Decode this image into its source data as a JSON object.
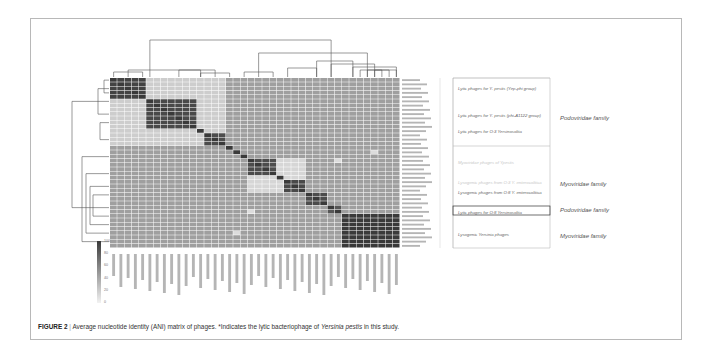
{
  "caption": {
    "figure_label": "FIGURE 2",
    "separator": "|",
    "text": "Average nucleotide identity (ANI) matrix of phages. *Indicates the lytic bacteriophage of ",
    "italic": "Yersinia pestis",
    "tail": " in this study."
  },
  "groups": [
    {
      "label": "Lytic phages for Y. pestis (Yep-phi group)",
      "faint": false
    },
    {
      "label": "Lytic phages for Y. pestis (phi-A1122 group)",
      "faint": false
    },
    {
      "label": "Lytic phages for  O:3 Yersinosoltia",
      "faint": false
    },
    {
      "label": "Myoviridae phages of Ypestis",
      "faint": true
    },
    {
      "label": "Lysogenic phages from O:3 Y. enterocolitica",
      "faint": true
    },
    {
      "label": "Lysogenic phages from O:8 Y. enterocolitica",
      "faint": false
    },
    {
      "label": "Lytic phages for  O:8 Yersinosoltia",
      "faint": false
    },
    {
      "label": "Lysogenic Yersinia phages",
      "faint": false
    }
  ],
  "families": [
    {
      "label": "Podoviridae family"
    },
    {
      "label": "Myoviridae family"
    },
    {
      "label": "Podoviridae family"
    },
    {
      "label": "Myoviridae family"
    }
  ],
  "colorbar": {
    "ticks": [
      "100",
      "80",
      "60",
      "40",
      "20",
      "0"
    ],
    "high_color": "#3a3a3a",
    "low_color": "#f2f2f2"
  },
  "chart_data": {
    "type": "heatmap",
    "title": "Average nucleotide identity (ANI) matrix of phages",
    "xlabel": "",
    "ylabel": "",
    "value_range": [
      0,
      100
    ],
    "n_phages": 40,
    "note": "Individual phage labels are illegible at screenshot resolution; block structure estimated from shading.",
    "blocks": [
      {
        "rows": [
          0,
          5
        ],
        "value": 95,
        "group": "Lytic phages for Y. pestis (Yep-phi group)"
      },
      {
        "rows": [
          5,
          12
        ],
        "value": 92,
        "group": "Lytic phages for Y. pestis (phi-A1122 group)"
      },
      {
        "rows": [
          12,
          13
        ],
        "value": 100
      },
      {
        "rows": [
          13,
          16
        ],
        "value": 90,
        "group": "Lytic phages for O:3 Y. enterocolitica"
      },
      {
        "rows": [
          16,
          17
        ],
        "value": 100
      },
      {
        "rows": [
          17,
          18
        ],
        "value": 100
      },
      {
        "rows": [
          18,
          19
        ],
        "value": 100
      },
      {
        "rows": [
          19,
          23
        ],
        "value": 90,
        "group": "Myoviridae phages of Y. pestis"
      },
      {
        "rows": [
          23,
          24
        ],
        "value": 100
      },
      {
        "rows": [
          24,
          27
        ],
        "value": 92,
        "group": "Lysogenic phages from O:3 Y. enterocolitica"
      },
      {
        "rows": [
          27,
          30
        ],
        "value": 90,
        "group": "Lysogenic phages from O:8 Y. enterocolitica"
      },
      {
        "rows": [
          30,
          32
        ],
        "value": 85,
        "group": "Lytic phages for O:8 Y. enterocolitica"
      },
      {
        "rows": [
          32,
          40
        ],
        "value": 100,
        "group": "Lysogenic Yersinia phages"
      }
    ],
    "background_value": 45,
    "light_regions_value": 15,
    "legend": {
      "position": "bottom-left",
      "ticks": [
        100,
        80,
        60,
        40,
        20,
        0
      ]
    }
  }
}
